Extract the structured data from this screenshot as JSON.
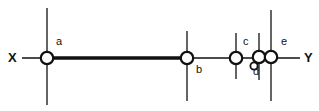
{
  "figure": {
    "kind": "number-line-diagram",
    "background_color": "#ffffff",
    "ink_color": "#111111",
    "width": 319,
    "height": 111
  },
  "axis": {
    "name": "horizontal-axis",
    "left_label": "X",
    "right_label": "Y",
    "y": 58,
    "x_start": 22,
    "x_end": 300,
    "stroke_width": 1.4,
    "left_label_x": 8,
    "left_label_y": 51,
    "right_label_x": 304,
    "right_label_y": 51
  },
  "segment": {
    "name": "thick-segment-a-b",
    "from": "a",
    "to": "b",
    "x_start": 47,
    "x_end": 187,
    "y": 58,
    "stroke_width": 3.4
  },
  "points": [
    {
      "id": "a",
      "label": "a",
      "cx": 47,
      "cy": 58,
      "r": 6.2,
      "stroke_width": 2.2,
      "tick_top": 8,
      "tick_bottom": 105,
      "tick_stroke_width": 1.3,
      "label_x": 56,
      "label_y": 36
    },
    {
      "id": "b",
      "label": "b",
      "cx": 187,
      "cy": 58,
      "r": 6.2,
      "stroke_width": 2.2,
      "tick_top": 31,
      "tick_bottom": 101,
      "tick_stroke_width": 1.3,
      "label_x": 196,
      "label_y": 64
    },
    {
      "id": "c",
      "label": "c",
      "cx": 236,
      "cy": 58,
      "r": 6.2,
      "stroke_width": 2.2,
      "tick_top": 33,
      "tick_bottom": 79,
      "tick_stroke_width": 1.3,
      "label_x": 243,
      "label_y": 36
    },
    {
      "id": "d",
      "label": "d",
      "cx": 259,
      "cy": 57,
      "r": 6.2,
      "stroke_width": 2.2,
      "tick_top": 33,
      "tick_bottom": 80,
      "tick_stroke_width": 1.3,
      "label_x": 253,
      "label_y": 66
    },
    {
      "id": "e",
      "label": "e",
      "cx": 271,
      "cy": 57,
      "r": 6.2,
      "stroke_width": 2.2,
      "tick_top": 10,
      "tick_bottom": 101,
      "tick_stroke_width": 1.3,
      "label_x": 281,
      "label_y": 36
    }
  ],
  "extra_marks": [
    {
      "id": "d-small-marker",
      "name": "small-circle-below-d",
      "cx": 254,
      "cy": 66,
      "r": 3.6,
      "stroke_width": 1.8
    }
  ]
}
